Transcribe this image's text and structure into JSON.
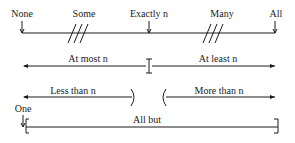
{
  "diagram": {
    "top_scale": {
      "labels": {
        "none": "None",
        "some": "Some",
        "exactly_n": "Exactly n",
        "many": "Many",
        "all": "All"
      }
    },
    "at_most_at_least": {
      "at_most": "At most n",
      "at_least": "At least n"
    },
    "less_more": {
      "less_than": "Less than n",
      "more_than": "More than n"
    },
    "one_all_but": {
      "one": "One",
      "all_but": "All but"
    },
    "colors": {
      "line": "#1a1a1a",
      "background": "#ffffff"
    }
  }
}
